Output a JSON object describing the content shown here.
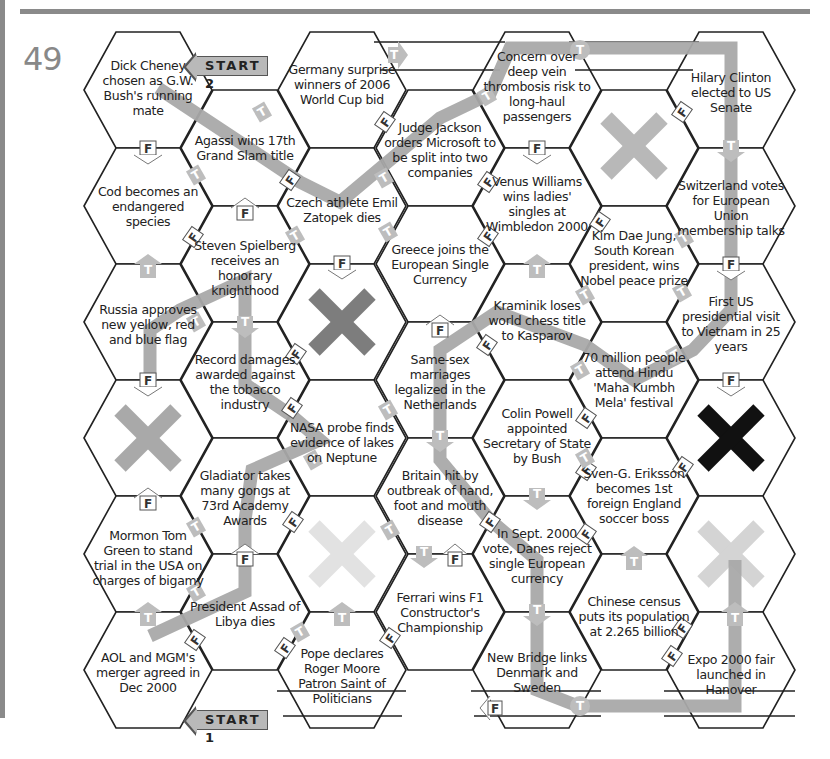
{
  "page": {
    "number": "49"
  },
  "start_labels": {
    "start1": "START 1",
    "start2": "START 2"
  },
  "colors": {
    "path": "#a9a9a9",
    "x_dark": "#7d7d7d",
    "x_mid": "#b8b8b8",
    "x_light": "#dcdcdc",
    "x_black": "#111111",
    "hex_stroke": "#222222"
  },
  "hexes": {
    "c0r0": "Dick Cheney chosen as G.W. Bush's running mate",
    "c0r1": "Cod becomes an endangered species",
    "c0r2": "Russia approves new yellow, red and blue flag",
    "c0r3": "",
    "c0r4": "Mormon Tom Green to stand trial in the USA on charges of bigamy",
    "c0r5": "AOL and MGM's merger agreed in Dec 2000",
    "c1r0": "Agassi wins 17th Grand Slam title",
    "c1r1": "Steven Spielberg receives an honorary knighthood",
    "c1r2": "Record damages awarded against the tobacco industry",
    "c1r3": "Gladiator takes many gongs at 73rd Academy Awards",
    "c1r4": "President Assad of Libya dies",
    "c2r0": "Germany surprise winners of 2006 World Cup bid",
    "c2r1": "Czech athlete Emil Zatopek dies",
    "c2r2": "",
    "c2r3": "NASA probe finds evidence of lakes on Neptune",
    "c2r4": "",
    "c2r5": "Pope declares Roger Moore Patron Saint of Politicians",
    "c3r0": "Judge Jackson orders Microsoft to be split into two companies",
    "c3r1": "Greece joins the European Single Currency",
    "c3r2": "Same-sex marriages legalized in the Netherlands",
    "c3r3": "Britain hit by outbreak of hand, foot and mouth disease",
    "c3r4": "Ferrari wins F1 Constructor's Championship",
    "c4r0": "Concern over deep vein thrombosis risk to long-haul passengers",
    "c4r1": "Venus Williams wins ladies' singles at Wimbledon 2000",
    "c4r2": "Kraminik loses world chess title to Kasparov",
    "c4r3": "Colin Powell appointed Secretary of State by Bush",
    "c4r4": "In Sept. 2000 vote, Danes reject single European currency",
    "c4r5": "New Bridge links Denmark and Sweden",
    "c5r0": "",
    "c5r1": "Kim Dae Jung, South Korean president, wins Nobel peace prize",
    "c5r2": "70 million people attend Hindu 'Maha Kumbh Mela' festival",
    "c5r3": "Sven-G. Eriksson becomes 1st foreign England soccer boss",
    "c5r4": "Chinese census puts its population at 2.265 billion",
    "c6r0": "Hilary Clinton elected to US Senate",
    "c6r1": "Switzerland votes for European Union membership talks",
    "c6r2": "First US presidential visit to Vietnam in 25 years",
    "c6r3": "",
    "c6r4": "",
    "c6r5": "Expo 2000 fair launched in Hanover"
  },
  "markers": {
    "true": "T",
    "false": "F"
  }
}
